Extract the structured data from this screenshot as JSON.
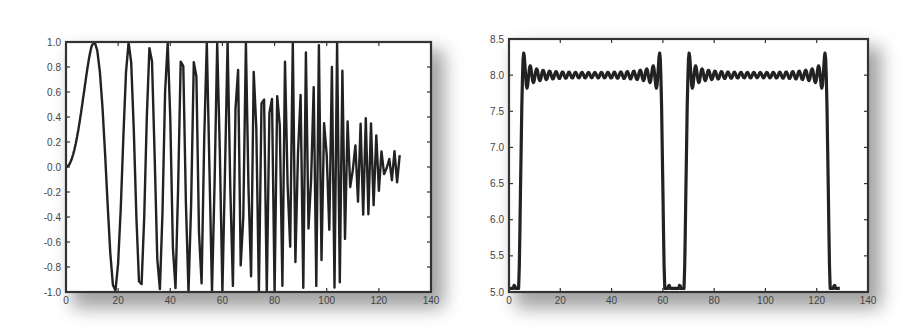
{
  "chart_data": [
    {
      "type": "line",
      "title": "",
      "xlabel": "",
      "ylabel": "",
      "xlim": [
        0,
        140
      ],
      "ylim": [
        -1.0,
        1.0
      ],
      "xticks": [
        "0",
        "20",
        "40",
        "60",
        "80",
        "100",
        "120",
        "140"
      ],
      "yticks": [
        "-1.0",
        "-0.8",
        "-0.6",
        "-0.4",
        "-0.2",
        "0.0",
        "0.2",
        "0.4",
        "0.6",
        "0.8",
        "1.0"
      ],
      "grid": false,
      "legend": null,
      "series": [
        {
          "name": "chirp",
          "description": "Sine chirp sin(pi*t^2/ (2*T)) style signal with increasing frequency from t=0 to t~128, amplitude 1, sampled sparsely so high-frequency peaks alias; tapers to 0 near t=128",
          "x_start": 0,
          "x_end": 128,
          "samples": 129,
          "amplitude": 1.0
        }
      ]
    },
    {
      "type": "line",
      "title": "",
      "xlabel": "",
      "ylabel": "",
      "xlim": [
        0,
        140
      ],
      "ylim": [
        5.0,
        8.5
      ],
      "xticks": [
        "0",
        "20",
        "40",
        "60",
        "80",
        "100",
        "120",
        "140"
      ],
      "yticks": [
        "5.0",
        "5.5",
        "6.0",
        "6.5",
        "7.0",
        "7.5",
        "8.0",
        "8.5"
      ],
      "grid": false,
      "legend": null,
      "series": [
        {
          "name": "fourier-square-wave",
          "description": "Band-limited square wave with Gibbs ringing, two pulses",
          "x_start": 0,
          "x_end": 129,
          "baseline": 5.0,
          "plateau": 8.0,
          "overshoot_peak": 8.27,
          "undershoot": 7.88,
          "pulses": [
            [
              4,
              60
            ],
            [
              68,
              125
            ]
          ],
          "minima": [
            {
              "x": 0,
              "y": 5.15
            },
            {
              "x": 65,
              "y": 5.05
            },
            {
              "x": 129,
              "y": 5.15
            }
          ]
        }
      ]
    }
  ],
  "colors": {
    "line": "#222222",
    "axes": "#333333",
    "tick_label": "#444444",
    "shadow": "#555555",
    "background": "#ffffff"
  },
  "panels": [
    {
      "box": {
        "left": 66,
        "top": 42,
        "right": 431,
        "bottom": 292
      }
    },
    {
      "box": {
        "left": 509,
        "top": 39,
        "right": 868,
        "bottom": 292
      }
    }
  ]
}
